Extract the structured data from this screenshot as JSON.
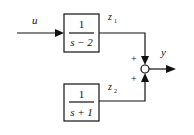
{
  "diagram": {
    "input": {
      "label": "u"
    },
    "output": {
      "label": "y"
    },
    "blocks": [
      {
        "id": "block1",
        "numerator": "1",
        "denominator": "s − 2",
        "output_signal": {
          "name": "z",
          "subscript": "1"
        }
      },
      {
        "id": "block2",
        "numerator": "1",
        "denominator": "s + 1",
        "output_signal": {
          "name": "z",
          "subscript": "2"
        }
      }
    ],
    "summing_junction": {
      "signs": [
        "+",
        "+"
      ]
    },
    "colors": {
      "stroke": "#111111",
      "background": "#ffffff"
    }
  }
}
